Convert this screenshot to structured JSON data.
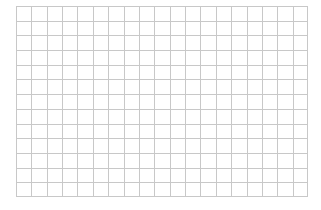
{
  "grid": {
    "columns": 19,
    "rows": 13,
    "line_color": "#c8c8c8",
    "background": "#ffffff"
  }
}
